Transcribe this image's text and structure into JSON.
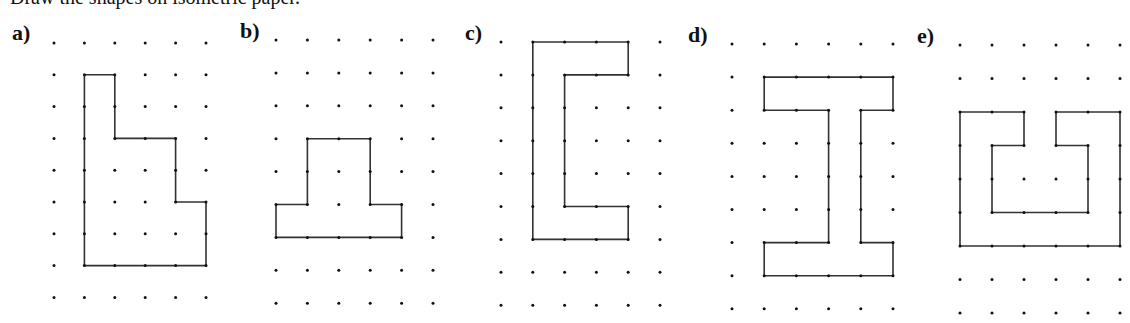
{
  "header": {
    "cropped_text": "Draw the shapes on isometric paper."
  },
  "style": {
    "dot_color": "#111111",
    "line_color": "#333333"
  },
  "figures": [
    {
      "label": "a)",
      "label_pos": [
        12,
        42
      ],
      "origin": [
        54,
        43
      ],
      "dx": 30.4,
      "dy": 31.8,
      "cols": 6,
      "rows": 9,
      "polygon": [
        [
          1,
          1
        ],
        [
          2,
          1
        ],
        [
          2,
          3
        ],
        [
          4,
          3
        ],
        [
          4,
          5
        ],
        [
          5,
          5
        ],
        [
          5,
          7
        ],
        [
          1,
          7
        ]
      ]
    },
    {
      "label": "b)",
      "label_pos": [
        240,
        40
      ],
      "origin": [
        276,
        40
      ],
      "dx": 31.4,
      "dy": 32.9,
      "cols": 6,
      "rows": 9,
      "polygon": [
        [
          1,
          3
        ],
        [
          3,
          3
        ],
        [
          3,
          5
        ],
        [
          4,
          5
        ],
        [
          4,
          6
        ],
        [
          0,
          6
        ],
        [
          0,
          5
        ],
        [
          1,
          5
        ]
      ]
    },
    {
      "label": "c)",
      "label_pos": [
        465,
        42
      ],
      "origin": [
        501,
        42
      ],
      "dx": 31.8,
      "dy": 32.9,
      "cols": 6,
      "rows": 9,
      "polygon": [
        [
          1,
          0
        ],
        [
          4,
          0
        ],
        [
          4,
          1
        ],
        [
          2,
          1
        ],
        [
          2,
          5
        ],
        [
          4,
          5
        ],
        [
          4,
          6
        ],
        [
          1,
          6
        ]
      ]
    },
    {
      "label": "d)",
      "label_pos": [
        688,
        44
      ],
      "origin": [
        732,
        44
      ],
      "dx": 32.2,
      "dy": 33.1,
      "cols": 6,
      "rows": 9,
      "polygon": [
        [
          1,
          1
        ],
        [
          5,
          1
        ],
        [
          5,
          2
        ],
        [
          4,
          2
        ],
        [
          4,
          6
        ],
        [
          5,
          6
        ],
        [
          5,
          7
        ],
        [
          1,
          7
        ],
        [
          1,
          6
        ],
        [
          3,
          6
        ],
        [
          3,
          2
        ],
        [
          1,
          2
        ]
      ]
    },
    {
      "label": "e)",
      "label_pos": [
        917,
        45
      ],
      "origin": [
        960,
        45
      ],
      "dx": 32.0,
      "dy": 33.5,
      "cols": 6,
      "rows": 9,
      "polygon": [
        [
          0,
          2
        ],
        [
          2,
          2
        ],
        [
          2,
          3
        ],
        [
          1,
          3
        ],
        [
          1,
          5
        ],
        [
          4,
          5
        ],
        [
          4,
          3
        ],
        [
          3,
          3
        ],
        [
          3,
          2
        ],
        [
          5,
          2
        ],
        [
          5,
          6
        ],
        [
          0,
          6
        ]
      ]
    }
  ]
}
